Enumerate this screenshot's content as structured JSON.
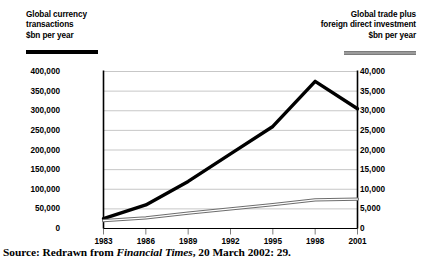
{
  "legend": {
    "left": {
      "line1": "Global currency",
      "line2": "transactions",
      "line3": "$bn per year",
      "swatch": "thick-black-line",
      "color": "#000000"
    },
    "right": {
      "line1": "Global trade plus",
      "line2": "foreign direct investment",
      "line3": "$bn per year",
      "swatch": "grey-double-line",
      "color": "#9b9b9b"
    }
  },
  "source": {
    "prefix": "Source: Redrawn from ",
    "publication": "Financial Times",
    "suffix": ", 20 March 2002: 29."
  },
  "chart_data": {
    "type": "line",
    "title": "",
    "xlabel": "",
    "grid": true,
    "legend_position": "top",
    "x": [
      1983,
      1986,
      1989,
      1992,
      1995,
      1998,
      2001
    ],
    "xtick_labels": [
      "1983",
      "1986",
      "1989",
      "1992",
      "1995",
      "1998",
      "2001"
    ],
    "axes": {
      "left": {
        "label": "Global currency transactions $bn per year",
        "ylim": [
          0,
          400000
        ],
        "ticks": [
          0,
          50000,
          100000,
          150000,
          200000,
          250000,
          300000,
          350000,
          400000
        ],
        "tick_labels": [
          "0",
          "50,000",
          "100,000",
          "150,000",
          "200,000",
          "250,000",
          "300,000",
          "350,000",
          "400,000"
        ]
      },
      "right": {
        "label": "Global trade plus foreign direct investment $bn per year",
        "ylim": [
          0,
          40000
        ],
        "ticks": [
          0,
          5000,
          10000,
          15000,
          20000,
          25000,
          30000,
          35000,
          40000
        ],
        "tick_labels": [
          "0",
          "5,000",
          "10,000",
          "15,000",
          "20,000",
          "25,000",
          "30,000",
          "35,000",
          "40,000"
        ]
      }
    },
    "series": [
      {
        "name": "Global currency transactions",
        "axis": "left",
        "color": "#000000",
        "style": "thick-solid",
        "values": [
          25000,
          60000,
          120000,
          190000,
          260000,
          375000,
          305000
        ]
      },
      {
        "name": "Global trade plus foreign direct investment",
        "axis": "right",
        "color": "#9b9b9b",
        "style": "grey-double",
        "values": [
          2000,
          2700,
          3900,
          5000,
          6100,
          7300,
          7500
        ]
      }
    ]
  }
}
